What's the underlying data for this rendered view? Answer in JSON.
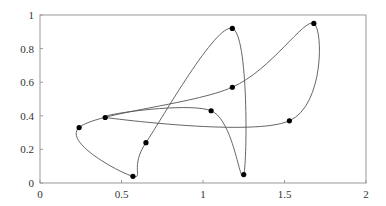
{
  "chart_data": {
    "type": "line",
    "title": "",
    "xlabel": "",
    "ylabel": "",
    "xlim": [
      0,
      2
    ],
    "ylim": [
      0,
      1
    ],
    "grid": false,
    "legend": null,
    "x_ticks": [
      0,
      0.5,
      1,
      1.5,
      2
    ],
    "x_tick_labels": [
      "0",
      "0.5",
      "1",
      "1.5",
      "2"
    ],
    "y_ticks": [
      0,
      0.2,
      0.4,
      0.6,
      0.8,
      1
    ],
    "y_tick_labels": [
      "0",
      "0.2",
      "0.4",
      "0.6",
      "0.8",
      "1"
    ],
    "series": [
      {
        "name": "control points",
        "closed": true,
        "points": [
          {
            "x": 0.4,
            "y": 0.39
          },
          {
            "x": 1.05,
            "y": 0.43
          },
          {
            "x": 1.25,
            "y": 0.05
          },
          {
            "x": 1.18,
            "y": 0.92
          },
          {
            "x": 0.65,
            "y": 0.24
          },
          {
            "x": 0.57,
            "y": 0.04
          },
          {
            "x": 0.24,
            "y": 0.33
          },
          {
            "x": 1.18,
            "y": 0.57
          },
          {
            "x": 1.68,
            "y": 0.95
          },
          {
            "x": 1.53,
            "y": 0.37
          }
        ]
      }
    ]
  },
  "colors": {
    "curve": "#555555",
    "points": "#000000",
    "axes": "#999999",
    "text": "#333333"
  }
}
